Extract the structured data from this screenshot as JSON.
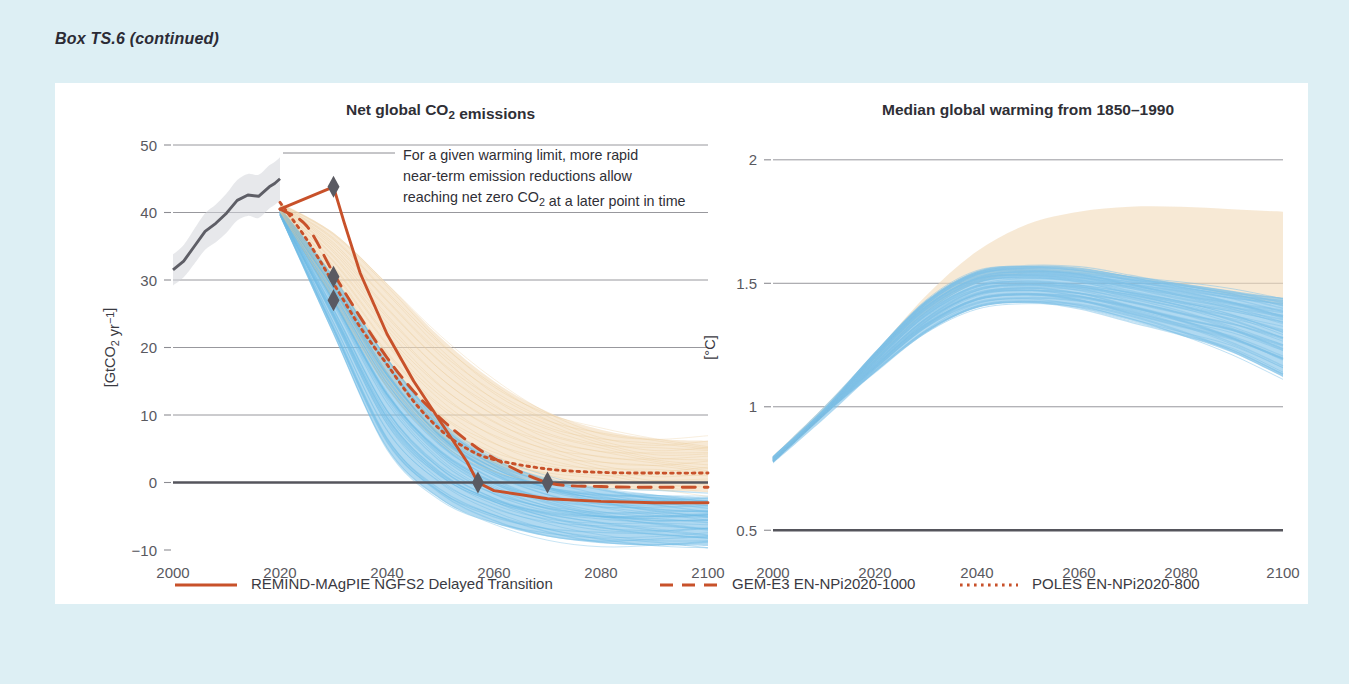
{
  "box_label": "Box TS.6 (continued)",
  "panel": {
    "background": "#ffffff",
    "page_background": "#ddeff4"
  },
  "colors": {
    "accent_orange": "#c8512a",
    "historical_gray": "#5e5e66",
    "band_blue": "#7fc2e8",
    "band_beige": "#f2dcbc",
    "marker_gray": "#5a5a62",
    "gridline": "#8c8c92",
    "text": "#3a3a42"
  },
  "annotation": {
    "lines": [
      "For a given warming limit, more rapid",
      "near-term emission reductions allow",
      "reaching net zero CO₂ at a later point in time"
    ]
  },
  "legend": {
    "items": [
      {
        "label": "REMIND-MAgPIE NGFS2 Delayed Transition",
        "style": "solid",
        "color": "#c8512a"
      },
      {
        "label": "GEM-E3 EN-NPi2020-1000",
        "style": "dashed",
        "color": "#c8512a"
      },
      {
        "label": "POLES EN-NPi2020-800",
        "style": "dotted",
        "color": "#c8512a"
      }
    ]
  },
  "chart_data": [
    {
      "id": "net-global-co2-emissions",
      "type": "line",
      "title": "Net global CO₂ emissions",
      "xlabel": "",
      "ylabel": "[GtCO₂ yr⁻¹]",
      "xlim": [
        2000,
        2100
      ],
      "ylim": [
        -10,
        50
      ],
      "xticks": [
        2000,
        2020,
        2040,
        2060,
        2080,
        2100
      ],
      "yticks": [
        -10,
        0,
        10,
        20,
        30,
        40,
        50
      ],
      "ytick_labels": [
        "−10",
        "0",
        "10",
        "20",
        "30",
        "40",
        "50"
      ],
      "grid": true,
      "zero_line": 0,
      "historical": {
        "name": "Historical emissions",
        "x": [
          2000,
          2002,
          2004,
          2006,
          2008,
          2010,
          2012,
          2014,
          2016,
          2018,
          2019,
          2020
        ],
        "y": [
          31.5,
          32.8,
          35.0,
          37.2,
          38.4,
          39.9,
          41.8,
          42.6,
          42.4,
          43.8,
          44.3,
          45.0
        ],
        "band_upper": [
          33.8,
          35.2,
          37.6,
          39.9,
          41.2,
          42.8,
          44.8,
          45.7,
          45.6,
          47.0,
          47.5,
          48.2
        ],
        "band_lower": [
          29.2,
          30.4,
          32.4,
          34.5,
          35.6,
          37.0,
          38.8,
          39.5,
          39.2,
          40.6,
          41.1,
          41.8
        ]
      },
      "bands": [
        {
          "name": "C3 scenario range (beige)",
          "color": "#f2dcbc",
          "x": [
            2020,
            2030,
            2040,
            2050,
            2060,
            2070,
            2080,
            2090,
            2100
          ],
          "upper": [
            41.5,
            37.0,
            29.5,
            21.5,
            15.0,
            10.5,
            7.8,
            6.5,
            6.2
          ],
          "lower": [
            40.0,
            27.0,
            14.0,
            6.0,
            2.0,
            0.0,
            -0.8,
            -1.2,
            -1.4
          ]
        },
        {
          "name": "C1 scenario range (blue)",
          "color": "#7fc2e8",
          "x": [
            2020,
            2030,
            2040,
            2050,
            2060,
            2070,
            2080,
            2090,
            2100
          ],
          "upper": [
            40.8,
            30.5,
            18.5,
            9.0,
            3.5,
            0.5,
            -1.0,
            -1.8,
            -2.2
          ],
          "lower": [
            39.5,
            22.0,
            5.0,
            -2.5,
            -6.0,
            -8.0,
            -9.0,
            -9.3,
            -9.4
          ]
        }
      ],
      "series": [
        {
          "name": "REMIND-MAgPIE NGFS2 Delayed Transition",
          "style": "solid",
          "color": "#c8512a",
          "x": [
            2020,
            2030,
            2032,
            2035,
            2040,
            2045,
            2050,
            2055,
            2057,
            2060,
            2070,
            2080,
            2090,
            2100
          ],
          "y": [
            40.5,
            43.8,
            38.5,
            31.0,
            22.0,
            15.0,
            9.0,
            3.0,
            0.0,
            -1.2,
            -2.4,
            -2.8,
            -3.0,
            -3.0
          ],
          "net_zero_year": 2057
        },
        {
          "name": "GEM-E3 EN-NPi2020-1000",
          "style": "dashed",
          "color": "#c8512a",
          "x": [
            2020,
            2025,
            2030,
            2035,
            2040,
            2045,
            2050,
            2055,
            2060,
            2070,
            2080,
            2090,
            2100
          ],
          "y": [
            40.5,
            38.0,
            31.0,
            24.5,
            18.5,
            13.5,
            9.5,
            6.2,
            3.6,
            0.0,
            -0.6,
            -0.7,
            -0.7
          ],
          "net_zero_year": 2070
        },
        {
          "name": "POLES EN-NPi2020-800",
          "style": "dotted",
          "color": "#c8512a",
          "x": [
            2020,
            2025,
            2030,
            2035,
            2040,
            2045,
            2050,
            2055,
            2060,
            2070,
            2080,
            2090,
            2100
          ],
          "y": [
            41.5,
            36.0,
            29.5,
            23.0,
            17.5,
            12.0,
            7.8,
            5.0,
            3.4,
            2.0,
            1.5,
            1.4,
            1.4
          ]
        }
      ],
      "markers": [
        {
          "x": 2030,
          "y": 43.8,
          "label": "peak emissions"
        },
        {
          "x": 2030,
          "y": 30.5,
          "label": "inflection"
        },
        {
          "x": 2030,
          "y": 27.0,
          "label": "inflection"
        },
        {
          "x": 2057,
          "y": 0,
          "label": "net zero CO2"
        },
        {
          "x": 2070,
          "y": 0,
          "label": "net zero CO2"
        }
      ]
    },
    {
      "id": "median-global-warming",
      "type": "line",
      "title": "Median global warming from 1850–1990",
      "xlabel": "",
      "ylabel": "[°C]",
      "xlim": [
        2000,
        2100
      ],
      "ylim": [
        0.42,
        2.06
      ],
      "xticks": [
        2000,
        2020,
        2040,
        2060,
        2080,
        2100
      ],
      "yticks": [
        0.5,
        1,
        1.5,
        2
      ],
      "ytick_labels": [
        "0.5",
        "1",
        "1.5",
        "2"
      ],
      "grid": true,
      "baseline": 0.5,
      "bands": [
        {
          "name": "C3 warming range (beige)",
          "color": "#f2dcbc",
          "x": [
            2000,
            2010,
            2020,
            2030,
            2040,
            2050,
            2060,
            2070,
            2080,
            2090,
            2100
          ],
          "upper": [
            0.8,
            1.0,
            1.22,
            1.45,
            1.63,
            1.74,
            1.79,
            1.81,
            1.81,
            1.8,
            1.79
          ],
          "lower": [
            0.78,
            0.97,
            1.18,
            1.38,
            1.5,
            1.54,
            1.54,
            1.52,
            1.49,
            1.45,
            1.41
          ]
        },
        {
          "name": "C1 warming range (blue)",
          "color": "#7fc2e8",
          "x": [
            2000,
            2010,
            2020,
            2030,
            2040,
            2050,
            2060,
            2070,
            2080,
            2090,
            2100
          ],
          "upper": [
            0.8,
            1.0,
            1.22,
            1.43,
            1.55,
            1.57,
            1.56,
            1.53,
            1.5,
            1.47,
            1.44
          ],
          "lower": [
            0.77,
            0.95,
            1.14,
            1.3,
            1.4,
            1.42,
            1.4,
            1.35,
            1.29,
            1.22,
            1.12
          ]
        }
      ],
      "series": [
        {
          "name": "median warming ensemble",
          "style": "spaghetti",
          "color": "#7fc2e8",
          "count": 56,
          "x": [
            2000,
            2010,
            2020,
            2030,
            2040,
            2050,
            2060,
            2070,
            2080,
            2090,
            2100
          ],
          "y": [
            0.78,
            0.98,
            1.18,
            1.37,
            1.48,
            1.5,
            1.48,
            1.44,
            1.4,
            1.35,
            1.28
          ]
        }
      ]
    }
  ]
}
